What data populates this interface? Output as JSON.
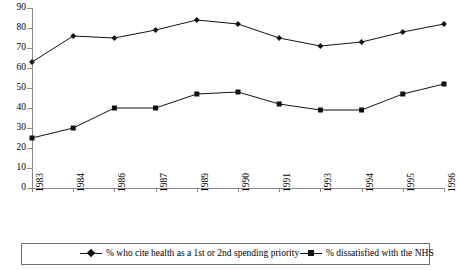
{
  "chart_data": {
    "type": "line",
    "title": "",
    "xlabel": "",
    "ylabel": "",
    "ylim": [
      0,
      90
    ],
    "yticks": [
      0,
      10,
      20,
      30,
      40,
      50,
      60,
      70,
      80,
      90
    ],
    "grid": false,
    "legend_position": "bottom",
    "categories": [
      "1983",
      "1984",
      "1986",
      "1987",
      "1989",
      "1990",
      "1991",
      "1993",
      "1994",
      "1995",
      "1996"
    ],
    "series": [
      {
        "name": "% who cite health as a 1st or 2nd spending priority",
        "marker": "diamond",
        "color": "#111111",
        "values": [
          63,
          76,
          75,
          79,
          84,
          82,
          75,
          71,
          73,
          78,
          82
        ]
      },
      {
        "name": "% dissatisfied with the NHS",
        "marker": "square",
        "color": "#111111",
        "values": [
          25,
          30,
          40,
          40,
          47,
          48,
          42,
          39,
          39,
          47,
          52
        ]
      }
    ]
  },
  "legend": {
    "entries": [
      {
        "label": "% who cite health as a 1st or 2nd spending priority",
        "marker": "diamond-marker-icon"
      },
      {
        "label": "% dissatisfied with the NHS",
        "marker": "square-marker-icon"
      }
    ]
  },
  "axes": {
    "y_tick_labels": [
      "90",
      "80",
      "70",
      "60",
      "50",
      "40",
      "30",
      "20",
      "10",
      "0"
    ],
    "x_tick_labels": [
      "1983",
      "1984",
      "1986",
      "1987",
      "1989",
      "1990",
      "1991",
      "1993",
      "1994",
      "1995",
      "1996"
    ]
  },
  "colors": {
    "axis": "#8a8a8a",
    "line": "#111111",
    "legend_border": "#6e6e6e",
    "background": "#ffffff"
  }
}
